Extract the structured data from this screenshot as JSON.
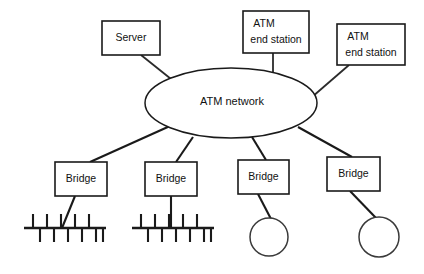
{
  "diagram": {
    "background_color": "#ffffff",
    "line_color": "#1a1a1a",
    "text_color": "#111111",
    "cloud": {
      "label": "ATM network",
      "shape": "ellipse",
      "cx": 231,
      "cy": 103,
      "rx": 86,
      "ry": 35
    },
    "top_nodes": [
      {
        "id": "server",
        "label": "Server",
        "shape": "rect",
        "x": 102,
        "y": 21,
        "w": 58,
        "h": 34
      },
      {
        "id": "atm-end-station-1",
        "label_line1": "ATM",
        "label_line2": "end station",
        "shape": "rect",
        "x": 243,
        "y": 11,
        "w": 66,
        "h": 42
      },
      {
        "id": "atm-end-station-2",
        "label_line1": "ATM",
        "label_line2": "end station",
        "shape": "rect",
        "x": 337,
        "y": 24,
        "w": 68,
        "h": 41
      }
    ],
    "bridges": [
      {
        "id": "bridge-1",
        "label": "Bridge",
        "x": 55,
        "y": 162,
        "w": 52,
        "h": 34,
        "attached_segment": "ethernet-bus-1"
      },
      {
        "id": "bridge-2",
        "label": "Bridge",
        "x": 145,
        "y": 162,
        "w": 52,
        "h": 34,
        "attached_segment": "ethernet-bus-2"
      },
      {
        "id": "bridge-3",
        "label": "Bridge",
        "x": 238,
        "y": 160,
        "w": 51,
        "h": 34,
        "attached_segment": "token-ring-1"
      },
      {
        "id": "bridge-4",
        "label": "Bridge",
        "x": 327,
        "y": 157,
        "w": 53,
        "h": 34,
        "attached_segment": "token-ring-2"
      }
    ],
    "ethernet_segments": [
      {
        "id": "ethernet-bus-1",
        "type": "bus",
        "x1": 24,
        "x2": 106,
        "y": 228,
        "stub_up_xs": [
          33,
          47,
          61,
          75,
          89
        ],
        "stub_down_xs": [
          40,
          54,
          68,
          82,
          96,
          103
        ],
        "stub_up_len": 14,
        "stub_down_len": 14
      },
      {
        "id": "ethernet-bus-2",
        "type": "bus",
        "x1": 132,
        "x2": 214,
        "y": 228,
        "stub_up_xs": [
          141,
          155,
          169,
          183,
          197
        ],
        "stub_down_xs": [
          148,
          162,
          176,
          190,
          204,
          211
        ],
        "stub_up_len": 14,
        "stub_down_len": 14
      }
    ],
    "token_rings": [
      {
        "id": "token-ring-1",
        "type": "ring",
        "cx": 269,
        "cy": 237,
        "r": 19
      },
      {
        "id": "token-ring-2",
        "type": "ring",
        "cx": 379,
        "cy": 237,
        "r": 20
      }
    ],
    "links": [
      {
        "id": "link-server-cloud",
        "from": "server",
        "to": "cloud",
        "x1": 141,
        "y1": 55,
        "x2": 176,
        "y2": 83
      },
      {
        "id": "link-ats1-cloud",
        "from": "atm-end-station-1",
        "to": "cloud",
        "x1": 273,
        "y1": 53,
        "x2": 273,
        "y2": 77
      },
      {
        "id": "link-ats2-cloud",
        "from": "atm-end-station-2",
        "to": "cloud",
        "x1": 349,
        "y1": 65,
        "x2": 312,
        "y2": 97
      },
      {
        "id": "link-cloud-bridge1",
        "from": "cloud",
        "to": "bridge-1",
        "x1": 170,
        "y1": 126,
        "x2": 90,
        "y2": 162
      },
      {
        "id": "link-cloud-bridge2",
        "from": "cloud",
        "to": "bridge-2",
        "x1": 193,
        "y1": 137,
        "x2": 176,
        "y2": 162
      },
      {
        "id": "link-cloud-bridge3",
        "from": "cloud",
        "to": "bridge-3",
        "x1": 252,
        "y1": 137,
        "x2": 266,
        "y2": 160
      },
      {
        "id": "link-cloud-bridge4",
        "from": "cloud",
        "to": "bridge-4",
        "x1": 298,
        "y1": 127,
        "x2": 352,
        "y2": 157
      },
      {
        "id": "link-bridge1-bus1",
        "from": "bridge-1",
        "to": "ethernet-bus-1",
        "x1": 75,
        "y1": 196,
        "x2": 62,
        "y2": 228
      },
      {
        "id": "link-bridge2-bus2",
        "from": "bridge-2",
        "to": "ethernet-bus-2",
        "x1": 171,
        "y1": 196,
        "x2": 171,
        "y2": 228
      },
      {
        "id": "link-bridge3-ring1",
        "from": "bridge-3",
        "to": "token-ring-1",
        "x1": 258,
        "y1": 194,
        "x2": 271,
        "y2": 219
      },
      {
        "id": "link-bridge4-ring2",
        "from": "bridge-4",
        "to": "token-ring-2",
        "x1": 350,
        "y1": 191,
        "x2": 376,
        "y2": 218
      }
    ]
  }
}
